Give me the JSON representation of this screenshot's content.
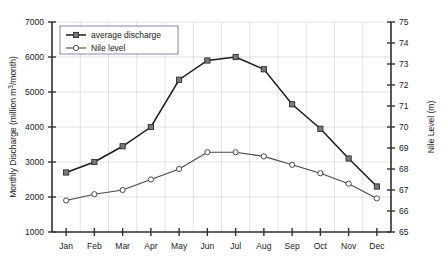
{
  "chart_data": {
    "type": "line",
    "title": "",
    "xlabel": "",
    "ylabel": "Monthly Discharge (million m³/month)",
    "y2label": "Nile Level (m)",
    "categories": [
      "Jan",
      "Feb",
      "Mar",
      "Apr",
      "May",
      "Jun",
      "Jul",
      "Aug",
      "Sep",
      "Oct",
      "Nov",
      "Dec"
    ],
    "ylim": [
      1000,
      7000
    ],
    "y2lim": [
      65,
      75
    ],
    "yticks": [
      1000,
      2000,
      3000,
      4000,
      5000,
      6000,
      7000
    ],
    "y2ticks": [
      65,
      66,
      67,
      68,
      69,
      70,
      71,
      72,
      73,
      74,
      75
    ],
    "grid": true,
    "legend_position": "top-left",
    "series": [
      {
        "name": "average discharge",
        "axis": "left",
        "marker": "filled-square",
        "values": [
          2700,
          3000,
          3450,
          4000,
          5350,
          5900,
          6000,
          5650,
          4650,
          3950,
          3100,
          2300
        ]
      },
      {
        "name": "Nile level",
        "axis": "right",
        "marker": "open-circle",
        "values": [
          66.5,
          66.8,
          67.0,
          67.5,
          68.0,
          68.8,
          68.8,
          68.6,
          68.2,
          67.8,
          67.3,
          66.6
        ]
      }
    ]
  },
  "colors": {
    "discharge_line": "#1c1c1c",
    "level_line": "#4a4a4a",
    "grid": "#dcdcdc",
    "axis": "#333333",
    "legend_border": "#6b6b9a"
  }
}
